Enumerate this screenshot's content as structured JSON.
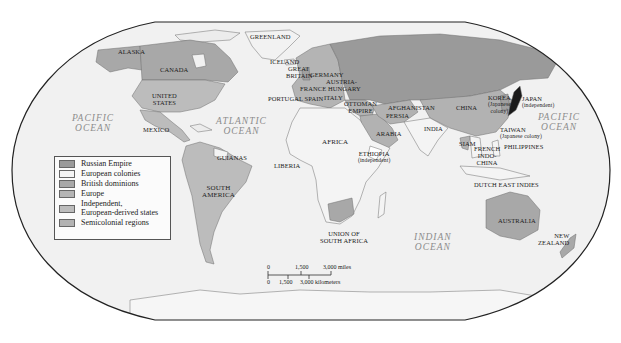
{
  "map": {
    "projection": "Robinson-style world map",
    "colors": {
      "ocean": "#f1f1f1",
      "russian_empire": "#9a9a9a",
      "european_colonies": "#f4f4f4",
      "british_dominions": "#a8a8a8",
      "europe": "#b4b4b4",
      "independent_european_derived": "#bcbcbc",
      "semicolonial": "#b2b2b2",
      "japan": "#1a1a1a",
      "frame": "#222222"
    },
    "legend": {
      "items": [
        {
          "label": "Russian Empire",
          "color": "#9a9a9a"
        },
        {
          "label": "European colonies",
          "color": "#f4f4f4"
        },
        {
          "label": "British dominions",
          "color": "#a8a8a8"
        },
        {
          "label": "Europe",
          "color": "#b4b4b4"
        },
        {
          "label": "Independent,",
          "label2": "European-derived states",
          "color": "#bcbcbc"
        },
        {
          "label": "Semicolonial regions",
          "color": "#b2b2b2"
        }
      ]
    },
    "oceans": {
      "pacific_west": [
        "PACIFIC",
        "OCEAN"
      ],
      "atlantic": [
        "ATLANTIC",
        "OCEAN"
      ],
      "indian": [
        "INDIAN",
        "OCEAN"
      ],
      "pacific_east": [
        "PACIFIC",
        "OCEAN"
      ]
    },
    "labels": {
      "alaska": "ALASKA",
      "canada": "CANADA",
      "greenland": "GREENLAND",
      "iceland": "ICELAND",
      "great_britain_1": "GREAT",
      "great_britain_2": "BRITAIN",
      "germany": "GERMANY",
      "austria": "AUSTRIA-",
      "hungary": "FRANCE HUNGARY",
      "portugal_spain": "PORTUGAL SPAIN",
      "italy": "ITALY",
      "united_states_1": "UNITED",
      "united_states_2": "STATES",
      "mexico": "MEXICO",
      "guianas": "GUIANAS",
      "liberia": "LIBERIA",
      "africa": "AFRICA",
      "ottoman_1": "OTTOMAN",
      "ottoman_2": "EMPIRE",
      "afghanistan": "AFGHANISTAN",
      "persia": "PERSIA",
      "arabia": "ARABIA",
      "ethiopia_1": "ETHIOPIA",
      "ethiopia_2": "(independent)",
      "india": "INDIA",
      "china": "CHINA",
      "korea_1": "KOREA",
      "korea_2": "(Japanese",
      "korea_3": "colony)",
      "japan_1": "JAPAN",
      "japan_2": "(independent)",
      "taiwan_1": "TAIWAN",
      "taiwan_2": "(Japanese colony)",
      "philippines": "PHILIPPINES",
      "siam": "SIAM",
      "indochina_1": "FRENCH",
      "indochina_2": "INDO-",
      "indochina_3": "CHINA",
      "dutch_east_indies": "DUTCH EAST INDIES",
      "south_america_1": "SOUTH",
      "south_america_2": "AMERICA",
      "union_sa_1": "UNION OF",
      "union_sa_2": "SOUTH AFRICA",
      "australia": "AUSTRALIA",
      "new_zealand_1": "NEW",
      "new_zealand_2": "ZEALAND"
    },
    "scale_bar": {
      "miles": [
        "0",
        "1,500",
        "3,000 miles"
      ],
      "kilometers": [
        "0",
        "1,500",
        "3,000 kilometers"
      ]
    }
  }
}
